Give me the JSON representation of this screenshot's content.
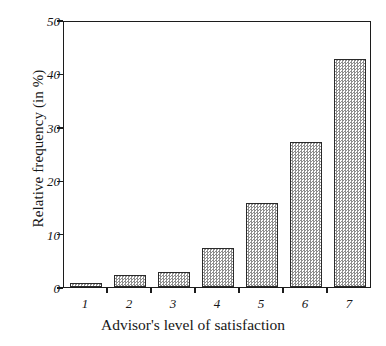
{
  "chart_data": {
    "type": "bar",
    "title": "",
    "xlabel": "Advisor's level of satisfaction",
    "ylabel": "Relative frequency (in %)",
    "categories": [
      "1",
      "2",
      "3",
      "4",
      "5",
      "6",
      "7"
    ],
    "values": [
      0.7,
      2.2,
      2.9,
      7.3,
      15.8,
      27.1,
      42.7
    ],
    "ylim": [
      0,
      50
    ],
    "yticks": [
      0,
      10,
      20,
      30,
      40,
      50
    ],
    "ytick_labels": [
      "0",
      "10",
      "20",
      "30",
      "40",
      "50"
    ],
    "xtick_labels": [
      "1",
      "2",
      "3",
      "4",
      "5",
      "6",
      "7"
    ],
    "grid": false,
    "legend": false,
    "bar_fill": "#f2f2f2",
    "bar_pattern": "checkered-stipple",
    "bar_border_color": "#2a2a2a",
    "axis_color": "#1c1c1c",
    "background": "#ffffff"
  }
}
